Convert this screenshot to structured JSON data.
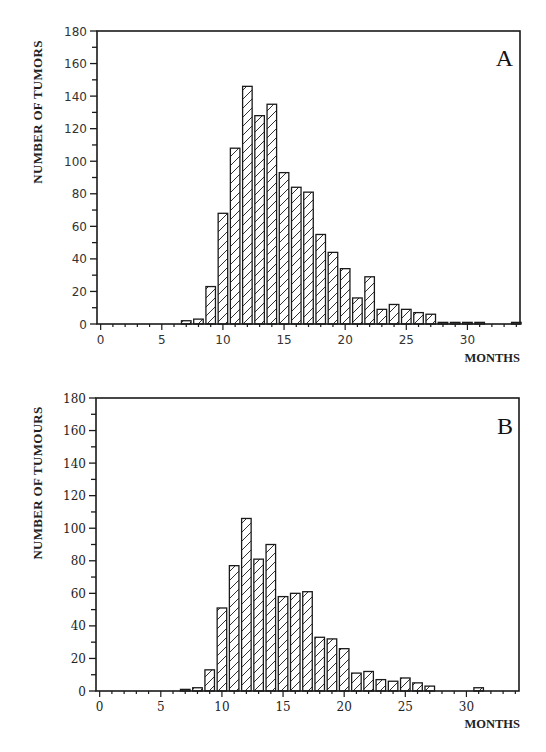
{
  "chart_data": [
    {
      "type": "bar",
      "panel_label": "A",
      "title": "",
      "xlabel": "MONTHS",
      "ylabel": "NUMBER OF TUMORS",
      "xlim": [
        -0.3,
        34.3
      ],
      "ylim": [
        0,
        180
      ],
      "xticks": [
        0,
        5,
        10,
        15,
        20,
        25,
        30
      ],
      "yticks": [
        0,
        20,
        40,
        60,
        80,
        100,
        120,
        140,
        160,
        180
      ],
      "tick_font": "sans",
      "grid": false,
      "legend": "none",
      "fill_pattern": "diagonal-hatch",
      "x": [
        7,
        8,
        9,
        10,
        11,
        12,
        13,
        14,
        15,
        16,
        17,
        18,
        19,
        20,
        21,
        22,
        23,
        24,
        25,
        26,
        27,
        28,
        29,
        30,
        31,
        34
      ],
      "values": [
        2,
        3,
        23,
        68,
        108,
        146,
        128,
        135,
        93,
        84,
        81,
        55,
        44,
        34,
        16,
        29,
        9,
        12,
        9,
        7,
        6,
        1,
        1,
        1,
        1,
        1
      ]
    },
    {
      "type": "bar",
      "panel_label": "B",
      "title": "",
      "xlabel": "MONTHS",
      "ylabel": "NUMBER OF TUMOURS",
      "xlim": [
        -0.3,
        34.3
      ],
      "ylim": [
        0,
        180
      ],
      "xticks": [
        0,
        5,
        10,
        15,
        20,
        25,
        30
      ],
      "yticks": [
        0,
        20,
        40,
        60,
        80,
        100,
        120,
        140,
        160,
        180
      ],
      "tick_font": "serif",
      "grid": false,
      "legend": "none",
      "fill_pattern": "diagonal-hatch",
      "x": [
        7,
        8,
        9,
        10,
        11,
        12,
        13,
        14,
        15,
        16,
        17,
        18,
        19,
        20,
        21,
        22,
        23,
        24,
        25,
        26,
        27,
        31
      ],
      "values": [
        1,
        2,
        13,
        51,
        77,
        106,
        81,
        90,
        58,
        60,
        61,
        33,
        32,
        26,
        11,
        12,
        7,
        6,
        8,
        5,
        3,
        2
      ]
    }
  ],
  "colors": {
    "ink": "#1a1a1a",
    "background": "#ffffff"
  }
}
